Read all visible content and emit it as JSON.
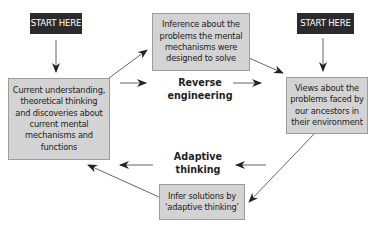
{
  "diagram": {
    "start_labels": {
      "left": "START HERE",
      "right": "START HERE"
    },
    "nodes": {
      "current_understanding": "Current understanding,\ntheoretical thinking\nand discoveries about\ncurrent mental\nmechanisms and\nfunctions",
      "inference": "Inference about the\nproblems the mental\nmechanisms were\ndesigned to solve",
      "views_ancestors": "Views about the\nproblems faced by\nour ancestors in\ntheir environment",
      "infer_solutions": "Infer solutions by\n‘adaptive thinking’"
    },
    "process_labels": {
      "reverse_engineering": "Reverse\nengineering",
      "adaptive_thinking": "Adaptive\nthinking"
    },
    "colors": {
      "start_bg": "#2b2b2b",
      "box_bg": "#d3d3d3",
      "box_border": "#9c9c9c",
      "arrow": "#333333"
    }
  }
}
